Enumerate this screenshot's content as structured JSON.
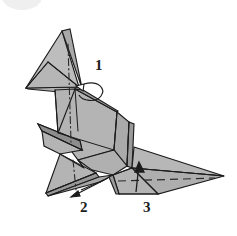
{
  "page": {
    "background_color": "#ffffff",
    "width": 237,
    "height": 236
  },
  "artwork": {
    "subject": "origami seal figure",
    "style": "line drawing with flat gray shading",
    "fill_color": "#b4b4b4",
    "fill_color_light": "#c8c8c8",
    "fill_color_dark": "#9a9a9a",
    "fill_color_shadow": "#8d8d8d",
    "outline_color": "#1c1c1c",
    "fold_line_color": "#2a2a2a",
    "hidden_edge_color": "#2a2a2a"
  },
  "watermark": {
    "name": "scan-artifact-circle",
    "color": "#efefef",
    "description": "faint pale circle at top-left corner"
  },
  "steps": [
    {
      "number": "1",
      "marker": "curved-rotation-arrow",
      "description": "open looped arrow at the neck pointing left"
    },
    {
      "number": "2",
      "marker": "straight-arrow-left",
      "description": "thin arrow at the lower-left foot pointing left"
    },
    {
      "number": "3",
      "marker": "straight-arrow-up",
      "description": "arrow on the tail pointing up"
    }
  ],
  "fold_lines": {
    "mountain_valley_center": "vertical dash-dot line down the body center",
    "hidden_tail_edge": "horizontal dashed line along the tail"
  }
}
